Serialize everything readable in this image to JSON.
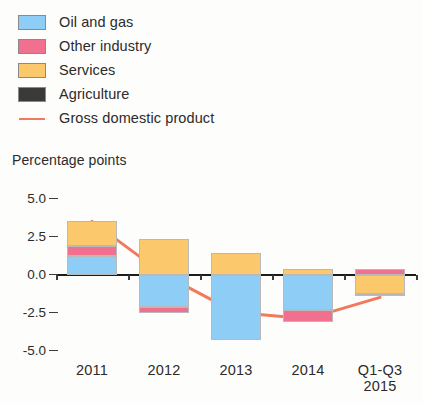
{
  "chart_data": {
    "type": "bar",
    "subtype": "stacked-bar-with-line",
    "title": "",
    "ylabel": "Percentage points",
    "xlabel": "",
    "ylim": [
      -5.0,
      5.0
    ],
    "ytick_labels": [
      "5.0",
      "2.5",
      "0.0",
      "-2.5",
      "-5.0"
    ],
    "ytick_values": [
      5.0,
      2.5,
      0.0,
      -2.5,
      -5.0
    ],
    "grid": false,
    "legend_position": "top-left",
    "categories": [
      "2011",
      "2012",
      "2013",
      "2014",
      "Q1-Q3 2015"
    ],
    "category_lines": [
      [
        "2011"
      ],
      [
        "2012"
      ],
      [
        "2013"
      ],
      [
        "2014"
      ],
      [
        "Q1-Q3",
        "2015"
      ]
    ],
    "series": [
      {
        "name": "Oil and gas",
        "color": "#8ecdf5",
        "values": [
          1.2,
          -2.1,
          -4.3,
          -2.35,
          0.0
        ]
      },
      {
        "name": "Other industry",
        "color": "#f2708f",
        "values": [
          0.65,
          -0.45,
          0.0,
          -0.75,
          0.4
        ]
      },
      {
        "name": "Services",
        "color": "#fbc96b",
        "values": [
          1.65,
          2.35,
          1.45,
          0.35,
          -1.3
        ]
      },
      {
        "name": "Agriculture",
        "color": "#3b3a38",
        "values": [
          0.0,
          0.0,
          0.0,
          0.0,
          -0.1
        ]
      }
    ],
    "line_series": {
      "name": "Gross domestic product",
      "color": "#f0795e",
      "values": [
        3.5,
        0.0,
        -2.5,
        -2.9,
        -1.5
      ]
    }
  },
  "legend": {
    "items": [
      {
        "label": "Oil and gas",
        "kind": "swatch",
        "color": "#8ecdf5"
      },
      {
        "label": "Other industry",
        "kind": "swatch",
        "color": "#f2708f"
      },
      {
        "label": "Services",
        "kind": "swatch",
        "color": "#fbc96b"
      },
      {
        "label": "Agriculture",
        "kind": "swatch",
        "color": "#3b3a38"
      },
      {
        "label": "Gross domestic product",
        "kind": "line",
        "color": "#f0795e"
      }
    ]
  }
}
